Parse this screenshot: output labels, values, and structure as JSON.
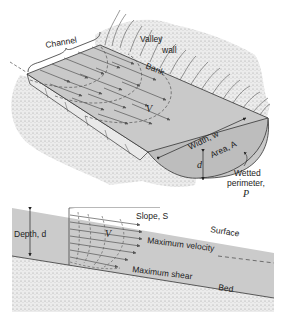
{
  "diagram": {
    "top_panel": {
      "labels": {
        "channel": "Channel",
        "valley": "Valley",
        "wall": "wall",
        "bank": "Bank",
        "velocity": "V",
        "width": "Width, w",
        "area": "Area, A",
        "depth": "d",
        "wetted_1": "Wetted",
        "wetted_2": "perimeter,",
        "wetted_symbol": "P"
      }
    },
    "bottom_panel": {
      "labels": {
        "depth": "Depth, d",
        "slope": "Slope, S",
        "surface": "Surface",
        "velocity": "V",
        "max_velocity": "Maximum velocity",
        "max_shear": "Maximum shear",
        "bed": "Bed"
      }
    },
    "colors": {
      "water": "#c9c9c9",
      "ground": "#e6e6e6",
      "line": "#333333",
      "arrow": "#555555"
    }
  }
}
